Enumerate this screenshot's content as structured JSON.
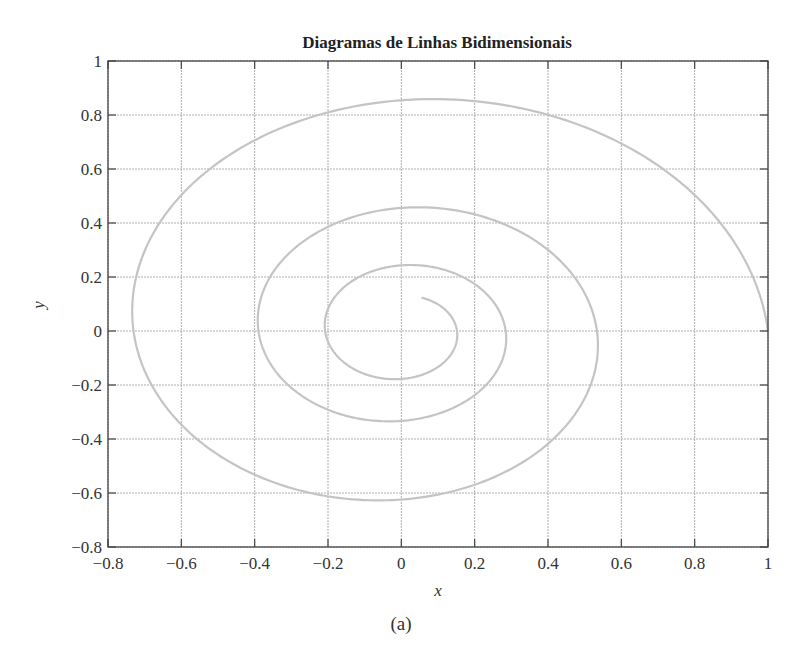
{
  "figure": {
    "caption": "(a)"
  },
  "chart_data": {
    "type": "line",
    "title": "Diagramas de Linhas Bidimensionais",
    "xlabel": "x",
    "ylabel": "y",
    "xlim": [
      -0.8,
      1
    ],
    "ylim": [
      -0.8,
      1
    ],
    "xticks": [
      -0.8,
      -0.6,
      -0.4,
      -0.2,
      0,
      0.2,
      0.4,
      0.6,
      0.8,
      1
    ],
    "yticks": [
      -0.8,
      -0.6,
      -0.4,
      -0.2,
      0,
      0.2,
      0.4,
      0.6,
      0.8,
      1
    ],
    "xtick_labels": [
      "−0.8",
      "−0.6",
      "−0.4",
      "−0.2",
      "0",
      "0.2",
      "0.4",
      "0.6",
      "0.8",
      "1"
    ],
    "ytick_labels": [
      "−0.8",
      "−0.6",
      "−0.4",
      "−0.2",
      "0",
      "0.2",
      "0.4",
      "0.6",
      "0.8",
      "1"
    ],
    "grid": true,
    "legend": null,
    "line_color": "#c4c4c4",
    "series": [
      {
        "name": "spiral",
        "description": "x = e^(-0.1t)·cos(t), y = e^(-0.1t)·sin(t), t from 0 to 20",
        "param": {
          "t_start": 0,
          "t_end": 20,
          "decay": 0.1
        },
        "key_points": [
          {
            "x": 1.0,
            "y": 0.0
          },
          {
            "x": 0.05,
            "y": 0.85
          },
          {
            "x": -0.74,
            "y": 0.05
          },
          {
            "x": -0.08,
            "y": -0.62
          },
          {
            "x": 0.53,
            "y": 0.0
          },
          {
            "x": 0.03,
            "y": 0.45
          },
          {
            "x": -0.39,
            "y": 0.0
          },
          {
            "x": 0.0,
            "y": -0.33
          },
          {
            "x": 0.28,
            "y": 0.0
          },
          {
            "x": 0.01,
            "y": 0.24
          },
          {
            "x": -0.21,
            "y": 0.0
          },
          {
            "x": 0.0,
            "y": -0.17
          },
          {
            "x": 0.15,
            "y": 0.0
          },
          {
            "x": 0.05,
            "y": 0.13
          }
        ]
      }
    ]
  }
}
